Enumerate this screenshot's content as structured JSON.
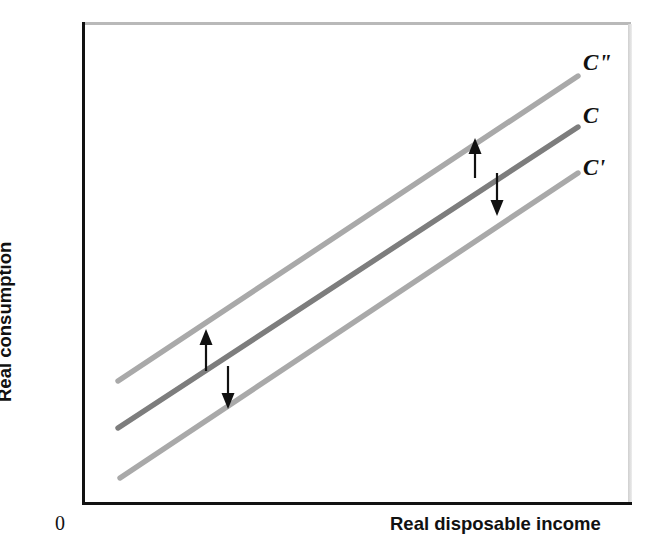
{
  "figure": {
    "background_color": "#ffffff",
    "axis_color": "#111111",
    "origin_label": "0"
  },
  "axes": {
    "x_title": "Real disposable income",
    "y_title": "Real consumption",
    "x_ticks": [],
    "y_ticks": [],
    "grid": false
  },
  "labels": {
    "c_double_prime": "C\"",
    "c_base": "C",
    "c_prime": "C'"
  },
  "colors": {
    "line_base": "#7d7d7d",
    "line_shifted": "#a9a9a9",
    "arrow": "#111111",
    "frame_shadow": "#b9b9b9"
  },
  "chart_data": {
    "type": "line",
    "title": "",
    "subtitle": "",
    "xlabel": "Real disposable income",
    "ylabel": "Real consumption",
    "xlim": [
      0,
      1
    ],
    "ylim": [
      0,
      1
    ],
    "grid": false,
    "legend_position": "right-of-line-ends",
    "axis_tick_labels": {
      "x": [],
      "y": []
    },
    "series": [
      {
        "name": "C\"",
        "label": "C\"",
        "color": "#a9a9a9",
        "width": 5,
        "description": "Upward-shifted consumption function (higher autonomous consumption)",
        "x": [
          0.066,
          1.0
        ],
        "y": [
          0.253,
          0.886
        ],
        "pixel_endpoints": [
          [
            118,
            381
          ],
          [
            578,
            76
          ]
        ]
      },
      {
        "name": "C",
        "label": "C",
        "color": "#7d7d7d",
        "width": 5,
        "description": "Baseline consumption function",
        "x": [
          0.066,
          1.0
        ],
        "y": [
          0.155,
          0.783
        ],
        "pixel_endpoints": [
          [
            118,
            428
          ],
          [
            578,
            127
          ]
        ]
      },
      {
        "name": "C'",
        "label": "C'",
        "color": "#a9a9a9",
        "width": 5,
        "description": "Downward-shifted consumption function (lower autonomous consumption)",
        "x": [
          0.07,
          1.0
        ],
        "y": [
          0.051,
          0.688
        ],
        "pixel_endpoints": [
          [
            120,
            478
          ],
          [
            578,
            173
          ]
        ]
      }
    ],
    "annotations": [
      {
        "name": "left-up-arrow",
        "direction": "up",
        "meaning": "upward shift of consumption function from C to C\"",
        "pixel_from": [
          206,
          371
        ],
        "pixel_to": [
          206,
          329
        ]
      },
      {
        "name": "left-down-arrow",
        "direction": "down",
        "meaning": "downward shift of consumption function from C to C'",
        "pixel_from": [
          228,
          366
        ],
        "pixel_to": [
          228,
          409
        ]
      },
      {
        "name": "right-up-arrow",
        "direction": "up",
        "meaning": "upward shift of consumption function from C to C\"",
        "pixel_from": [
          475,
          178
        ],
        "pixel_to": [
          475,
          138
        ]
      },
      {
        "name": "right-down-arrow",
        "direction": "down",
        "meaning": "downward shift of consumption function from C to C'",
        "pixel_from": [
          497,
          173
        ],
        "pixel_to": [
          497,
          216
        ]
      }
    ]
  }
}
